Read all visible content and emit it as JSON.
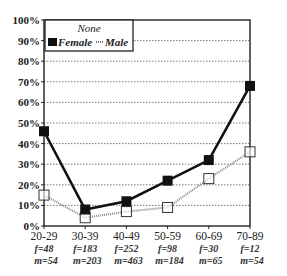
{
  "chart_data": {
    "type": "line",
    "title": "",
    "xlabel": "",
    "ylabel": "",
    "ylim": [
      0,
      100
    ],
    "y_ticks": [
      "0%",
      "10%",
      "20%",
      "30%",
      "40%",
      "50%",
      "60%",
      "70%",
      "80%",
      "90%",
      "100%"
    ],
    "grid": true,
    "legend": {
      "title": "None",
      "position": "top-left inside",
      "entries": [
        "Female",
        "Male"
      ]
    },
    "categories": [
      "20-29",
      "30-39",
      "40-49",
      "50-59",
      "60-69",
      "70-89"
    ],
    "category_counts": [
      {
        "f": "f=48",
        "m": "m=54"
      },
      {
        "f": "f=183",
        "m": "m=203"
      },
      {
        "f": "f=252",
        "m": "m=463"
      },
      {
        "f": "f=98",
        "m": "m=184"
      },
      {
        "f": "f=30",
        "m": "m=65"
      },
      {
        "f": "f=12",
        "m": "m=54"
      }
    ],
    "series": [
      {
        "name": "Female",
        "marker": "filled-square",
        "line": "solid-thick",
        "color": "#111111",
        "values": [
          46,
          8,
          12,
          22,
          32,
          68
        ]
      },
      {
        "name": "Male",
        "marker": "open-square",
        "line": "dotted-gray",
        "color": "#888888",
        "values": [
          15,
          4,
          7,
          9,
          23,
          36
        ]
      }
    ]
  }
}
